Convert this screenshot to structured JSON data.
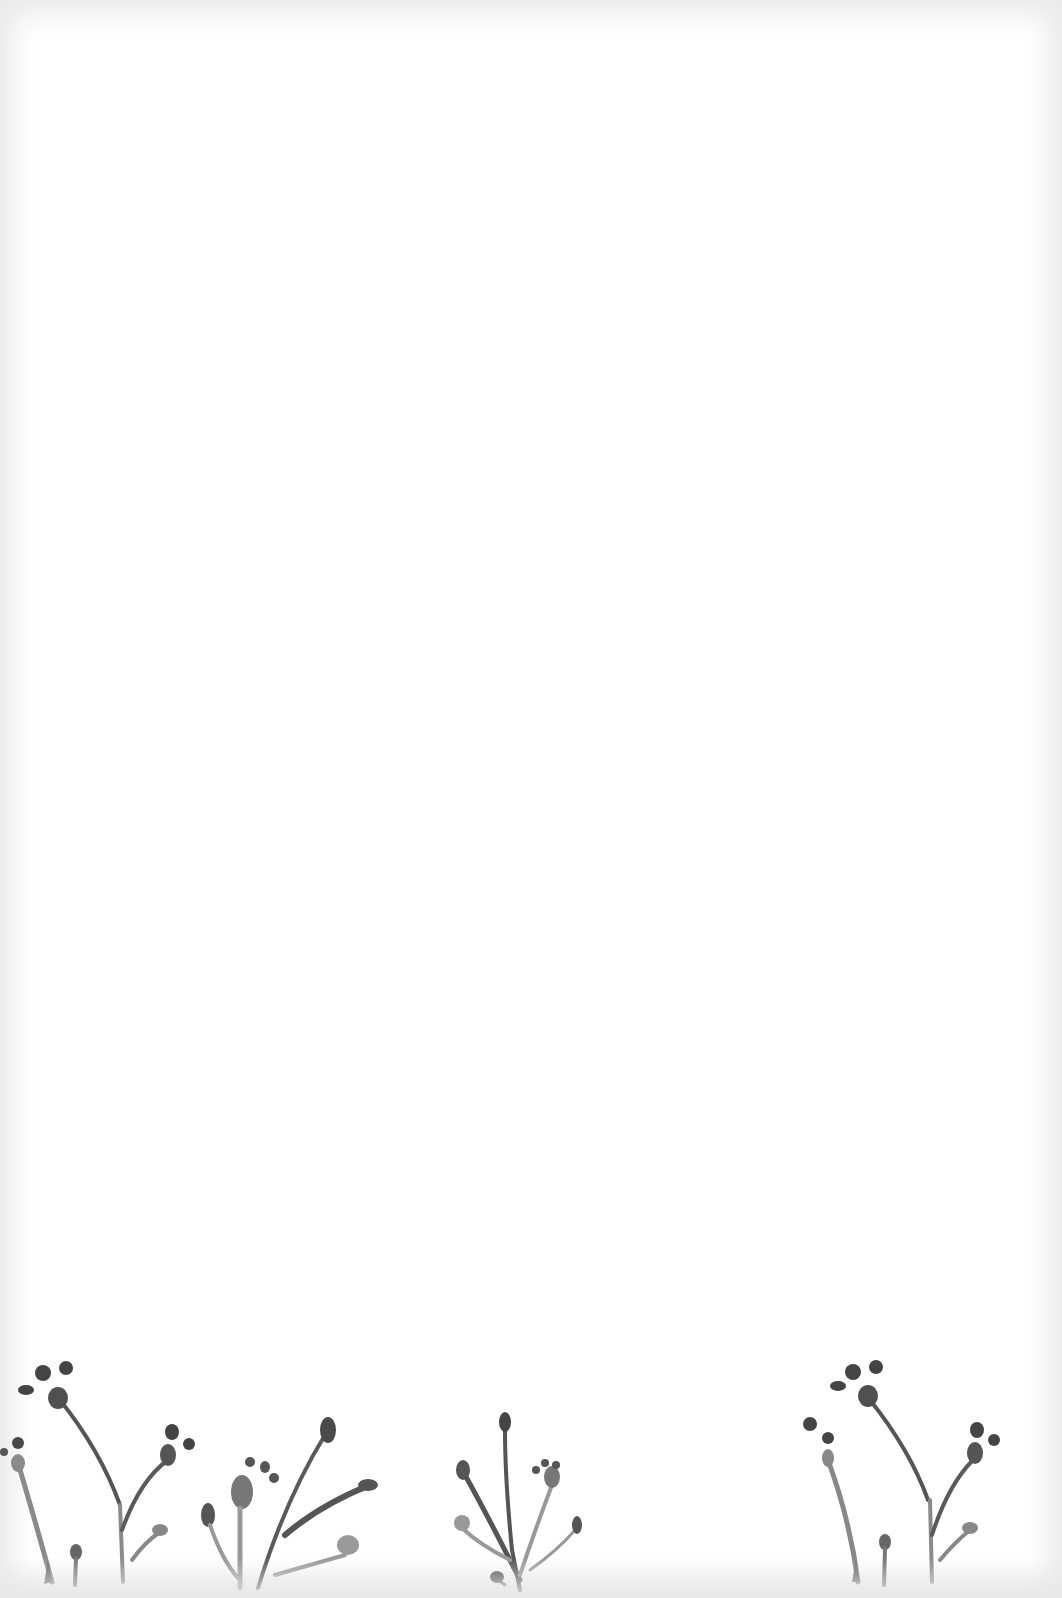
{
  "page": {
    "type": "blank stationery sheet",
    "background_color": "#ffffff",
    "border_shade": "#eaeaea",
    "bleed_through_text": "",
    "bleed_through_subtext": ""
  },
  "illustration": {
    "description": "watercolor botanical sprigs along bottom edge",
    "ink_dark": "#4a4a4a",
    "ink_mid": "#6e6e6e",
    "ink_light": "#9a9a9a",
    "groups": [
      {
        "name": "sprig-group-left",
        "x": 0
      },
      {
        "name": "sprig-group-left-center",
        "x": 195
      },
      {
        "name": "sprig-group-center",
        "x": 450
      },
      {
        "name": "sprig-group-right",
        "x": 780
      }
    ]
  }
}
